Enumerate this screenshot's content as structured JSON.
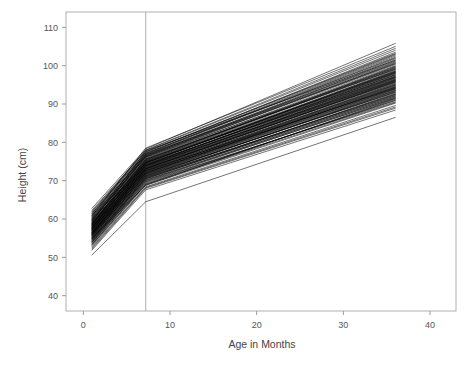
{
  "chart_data": {
    "type": "line",
    "title": "",
    "subtitle": "",
    "xlabel": "Age in Months",
    "ylabel": "Height (cm)",
    "xlim": [
      -2,
      43
    ],
    "ylim": [
      36,
      114
    ],
    "xticks": [
      0,
      10,
      20,
      30,
      40
    ],
    "xtick_labels": [
      "0",
      "10",
      "20",
      "30",
      "40"
    ],
    "yticks": [
      40,
      50,
      60,
      70,
      80,
      90,
      100,
      110
    ],
    "ytick_labels": [
      "40",
      "50",
      "60",
      "70",
      "80",
      "90",
      "100",
      "110"
    ],
    "grid": false,
    "legend": null,
    "annotations": [
      {
        "name": "breakpoint-reference-line",
        "type": "vline",
        "x": 7.2,
        "label": ""
      }
    ],
    "x": [
      1,
      7.2,
      36
    ],
    "series": [
      {
        "name": "subject-01",
        "values": [
          57.3,
          72.6,
          94.1
        ]
      },
      {
        "name": "subject-02",
        "values": [
          55.8,
          71.4,
          93.0
        ]
      },
      {
        "name": "subject-03",
        "values": [
          59.0,
          74.8,
          97.5
        ]
      },
      {
        "name": "subject-04",
        "values": [
          54.6,
          70.2,
          91.8
        ]
      },
      {
        "name": "subject-05",
        "values": [
          58.1,
          73.9,
          96.2
        ]
      },
      {
        "name": "subject-06",
        "values": [
          56.4,
          72.0,
          94.8
        ]
      },
      {
        "name": "subject-07",
        "values": [
          60.2,
          76.1,
          99.4
        ]
      },
      {
        "name": "subject-08",
        "values": [
          53.9,
          69.5,
          90.9
        ]
      },
      {
        "name": "subject-09",
        "values": [
          57.8,
          73.2,
          95.6
        ]
      },
      {
        "name": "subject-10",
        "values": [
          55.1,
          70.9,
          92.4
        ]
      },
      {
        "name": "subject-11",
        "values": [
          58.6,
          74.3,
          97.0
        ]
      },
      {
        "name": "subject-12",
        "values": [
          56.9,
          72.8,
          95.1
        ]
      },
      {
        "name": "subject-13",
        "values": [
          61.0,
          76.8,
          101.2
        ]
      },
      {
        "name": "subject-14",
        "values": [
          52.8,
          68.4,
          89.6
        ]
      },
      {
        "name": "subject-15",
        "values": [
          57.1,
          73.5,
          96.8
        ]
      },
      {
        "name": "subject-16",
        "values": [
          54.2,
          70.6,
          92.1
        ]
      },
      {
        "name": "subject-17",
        "values": [
          59.4,
          75.0,
          98.3
        ]
      },
      {
        "name": "subject-18",
        "values": [
          56.0,
          71.8,
          94.4
        ]
      },
      {
        "name": "subject-19",
        "values": [
          58.9,
          74.6,
          97.9
        ]
      },
      {
        "name": "subject-20",
        "values": [
          55.5,
          71.1,
          93.5
        ]
      },
      {
        "name": "subject-21",
        "values": [
          57.6,
          73.8,
          96.5
        ]
      },
      {
        "name": "subject-22",
        "values": [
          53.4,
          69.0,
          91.2
        ]
      },
      {
        "name": "subject-23",
        "values": [
          60.7,
          76.4,
          100.5
        ]
      },
      {
        "name": "subject-24",
        "values": [
          56.6,
          72.3,
          95.3
        ]
      },
      {
        "name": "subject-25",
        "values": [
          58.3,
          74.0,
          98.0
        ]
      },
      {
        "name": "subject-26",
        "values": [
          54.9,
          70.4,
          92.8
        ]
      },
      {
        "name": "subject-27",
        "values": [
          57.4,
          73.1,
          96.0
        ]
      },
      {
        "name": "subject-28",
        "values": [
          59.8,
          75.5,
          99.0
        ]
      },
      {
        "name": "subject-29",
        "values": [
          55.3,
          71.6,
          93.8
        ]
      },
      {
        "name": "subject-30",
        "values": [
          56.2,
          72.5,
          94.6
        ]
      },
      {
        "name": "subject-31",
        "values": [
          61.5,
          77.2,
          102.0
        ]
      },
      {
        "name": "subject-32",
        "values": [
          52.2,
          68.0,
          88.9
        ]
      },
      {
        "name": "subject-33",
        "values": [
          57.9,
          74.1,
          97.3
        ]
      },
      {
        "name": "subject-34",
        "values": [
          54.4,
          70.0,
          91.5
        ]
      },
      {
        "name": "subject-35",
        "values": [
          58.8,
          75.2,
          98.6
        ]
      },
      {
        "name": "subject-36",
        "values": [
          56.7,
          72.9,
          95.9
        ]
      },
      {
        "name": "subject-37",
        "values": [
          59.6,
          75.8,
          100.0
        ]
      },
      {
        "name": "subject-38",
        "values": [
          55.7,
          71.3,
          93.2
        ]
      },
      {
        "name": "subject-39",
        "values": [
          57.2,
          73.4,
          96.4
        ]
      },
      {
        "name": "subject-40",
        "values": [
          60.4,
          76.6,
          101.0
        ]
      },
      {
        "name": "subject-41",
        "values": [
          53.1,
          68.8,
          90.2
        ]
      },
      {
        "name": "subject-42",
        "values": [
          58.4,
          74.5,
          98.8
        ]
      },
      {
        "name": "subject-43",
        "values": [
          56.1,
          72.2,
          94.2
        ]
      },
      {
        "name": "subject-44",
        "values": [
          59.2,
          75.3,
          99.7
        ]
      },
      {
        "name": "subject-45",
        "values": [
          54.8,
          70.8,
          92.6
        ]
      },
      {
        "name": "subject-46",
        "values": [
          57.0,
          73.0,
          95.8
        ]
      },
      {
        "name": "subject-47",
        "values": [
          61.8,
          77.5,
          103.0
        ]
      },
      {
        "name": "subject-48",
        "values": [
          55.9,
          71.9,
          94.0
        ]
      },
      {
        "name": "subject-49",
        "values": [
          58.0,
          74.2,
          97.6
        ]
      },
      {
        "name": "subject-50",
        "values": [
          56.5,
          72.7,
          95.4
        ]
      },
      {
        "name": "subject-51",
        "values": [
          59.9,
          76.0,
          100.8
        ]
      },
      {
        "name": "subject-52",
        "values": [
          53.6,
          69.3,
          91.0
        ]
      },
      {
        "name": "subject-53",
        "values": [
          57.5,
          73.7,
          96.9
        ]
      },
      {
        "name": "subject-54",
        "values": [
          60.9,
          77.0,
          102.5
        ]
      },
      {
        "name": "subject-55",
        "values": [
          55.0,
          71.0,
          93.4
        ]
      },
      {
        "name": "subject-56",
        "values": [
          58.7,
          74.9,
          98.4
        ]
      },
      {
        "name": "subject-57",
        "values": [
          56.3,
          72.4,
          94.9
        ]
      },
      {
        "name": "subject-58",
        "values": [
          62.3,
          77.9,
          104.0
        ]
      },
      {
        "name": "subject-59",
        "values": [
          54.0,
          69.8,
          91.6
        ]
      },
      {
        "name": "subject-60",
        "values": [
          57.7,
          74.4,
          97.2
        ]
      },
      {
        "name": "subject-61",
        "values": [
          59.1,
          75.6,
          99.2
        ]
      },
      {
        "name": "subject-62",
        "values": [
          55.4,
          71.5,
          93.6
        ]
      },
      {
        "name": "subject-63",
        "values": [
          58.2,
          74.7,
          98.2
        ]
      },
      {
        "name": "subject-64",
        "values": [
          56.8,
          73.3,
          96.3
        ]
      },
      {
        "name": "subject-65",
        "values": [
          60.0,
          76.3,
          100.3
        ]
      },
      {
        "name": "subject-66",
        "values": [
          53.8,
          69.7,
          90.6
        ]
      },
      {
        "name": "subject-67",
        "values": [
          57.3,
          73.6,
          96.7
        ]
      },
      {
        "name": "subject-68",
        "values": [
          61.2,
          77.4,
          103.5
        ]
      },
      {
        "name": "subject-69",
        "values": [
          54.5,
          70.5,
          92.2
        ]
      },
      {
        "name": "subject-70",
        "values": [
          58.5,
          75.1,
          99.5
        ]
      },
      {
        "name": "subject-71",
        "values": [
          56.0,
          72.1,
          94.3
        ]
      },
      {
        "name": "subject-72",
        "values": [
          59.5,
          76.2,
          101.5
        ]
      },
      {
        "name": "subject-73",
        "values": [
          55.2,
          71.2,
          93.1
        ]
      },
      {
        "name": "subject-74",
        "values": [
          57.9,
          74.8,
          98.1
        ]
      },
      {
        "name": "subject-75",
        "values": [
          62.8,
          78.3,
          105.8
        ]
      },
      {
        "name": "subject-76",
        "values": [
          52.5,
          68.2,
          89.2
        ]
      },
      {
        "name": "subject-77",
        "values": [
          58.9,
          75.4,
          99.8
        ]
      },
      {
        "name": "subject-78",
        "values": [
          56.6,
          73.1,
          95.7
        ]
      },
      {
        "name": "subject-79",
        "values": [
          60.5,
          76.9,
          102.2
        ]
      },
      {
        "name": "subject-80",
        "values": [
          54.7,
          70.7,
          92.5
        ]
      },
      {
        "name": "subject-81",
        "values": [
          57.1,
          73.9,
          97.1
        ]
      },
      {
        "name": "subject-82",
        "values": [
          59.7,
          76.5,
          101.8
        ]
      },
      {
        "name": "subject-83",
        "values": [
          55.6,
          71.7,
          93.9
        ]
      },
      {
        "name": "subject-84",
        "values": [
          58.3,
          75.7,
          99.1
        ]
      },
      {
        "name": "subject-85",
        "values": [
          56.4,
          72.6,
          95.0
        ]
      },
      {
        "name": "subject-86",
        "values": [
          61.4,
          78.0,
          104.5
        ]
      },
      {
        "name": "subject-87",
        "values": [
          53.3,
          69.1,
          90.4
        ]
      },
      {
        "name": "subject-88",
        "values": [
          57.6,
          74.0,
          97.7
        ]
      },
      {
        "name": "subject-89",
        "values": [
          60.1,
          77.1,
          102.8
        ]
      },
      {
        "name": "subject-90",
        "values": [
          55.8,
          72.0,
          94.5
        ]
      },
      {
        "name": "subject-91",
        "values": [
          50.6,
          64.5,
          86.5
        ]
      },
      {
        "name": "subject-92",
        "values": [
          58.6,
          76.7,
          100.6
        ]
      },
      {
        "name": "subject-93",
        "values": [
          56.2,
          73.2,
          96.1
        ]
      },
      {
        "name": "subject-94",
        "values": [
          59.3,
          77.6,
          103.2
        ]
      },
      {
        "name": "subject-95",
        "values": [
          54.1,
          70.1,
          91.9
        ]
      },
      {
        "name": "subject-96",
        "values": [
          57.8,
          74.6,
          98.5
        ]
      },
      {
        "name": "subject-97",
        "values": [
          51.9,
          67.6,
          88.4
        ]
      },
      {
        "name": "subject-98",
        "values": [
          60.8,
          78.5,
          105.0
        ]
      },
      {
        "name": "subject-99",
        "values": [
          55.0,
          68.8,
          91.4
        ]
      },
      {
        "name": "subject-100",
        "values": [
          62.0,
          77.8,
          101.4
        ]
      }
    ]
  },
  "colors": {
    "line": "#000000",
    "frame": "#b0b0b0",
    "tick": "#9a9a9a",
    "tick_label": "#555555",
    "axis_title": "#444444",
    "background": "#ffffff",
    "reference_line": "#9a9a9a"
  }
}
